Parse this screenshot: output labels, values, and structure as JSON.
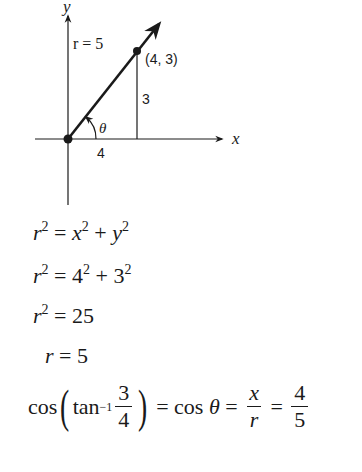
{
  "diagram": {
    "axis_labels": {
      "x": "x",
      "y": "y"
    },
    "radius_label": "r = 5",
    "point_label": "(4, 3)",
    "vertical_leg_label": "3",
    "horizontal_leg_label": "4",
    "angle_label": "θ",
    "point": {
      "x": 4,
      "y": 3
    },
    "stroke_color": "#1a1a1a"
  },
  "equations": {
    "line1": {
      "lhs": "r",
      "lhs_exp": "2",
      "eq": " = ",
      "a": "x",
      "a_exp": "2",
      "plus": " + ",
      "b": "y",
      "b_exp": "2"
    },
    "line2": {
      "lhs": "r",
      "lhs_exp": "2",
      "eq": " = ",
      "a": "4",
      "a_exp": "2",
      "plus": " + ",
      "b": "3",
      "b_exp": "2"
    },
    "line3": {
      "lhs": "r",
      "lhs_exp": "2",
      "eq": " = ",
      "rhs": "25"
    },
    "line4": {
      "lhs": "r",
      "eq": " = ",
      "rhs": "5"
    },
    "line5": {
      "cos": "cos",
      "tan": "tan",
      "tan_exp": "−1",
      "frac1_num": "3",
      "frac1_den": "4",
      "eq1": " = ",
      "cos_theta": "cos ",
      "theta": "θ",
      "eq2": " = ",
      "frac2_num": "x",
      "frac2_den": "r",
      "eq3": " = ",
      "frac3_num": "4",
      "frac3_den": "5"
    }
  }
}
